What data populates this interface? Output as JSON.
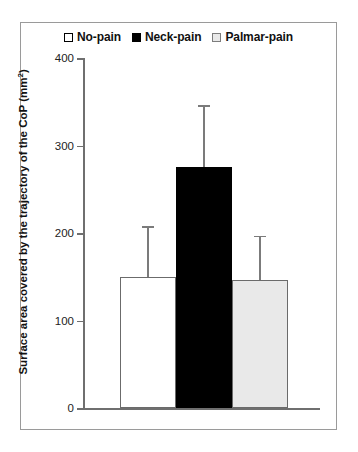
{
  "figure": {
    "background": "#ffffff",
    "frame_border_color": "#9a9a9a"
  },
  "legend": {
    "position": "top-center",
    "entries": [
      {
        "label": "No-pain",
        "swatch": "open-square-icon",
        "fill": "#ffffff",
        "edge": "#000000"
      },
      {
        "label": "Neck-pain",
        "swatch": "filled-square-icon",
        "fill": "#000000",
        "edge": "#000000"
      },
      {
        "label": "Palmar-pain",
        "swatch": "light-gray-square-icon",
        "fill": "#e9e9e9",
        "edge": "#7d7d7d"
      }
    ]
  },
  "axes": {
    "y_title_text": "Surface area covered by the trajectory of the CoP (mm",
    "y_title_sup": "2",
    "y_title_tail": ")",
    "y_ticks": [
      "0",
      "100",
      "200",
      "300",
      "400"
    ],
    "y_tick_values": [
      0,
      100,
      200,
      300,
      400
    ],
    "ylim": [
      0,
      400
    ],
    "x_ticks": [],
    "grid": false
  },
  "chart_data": {
    "type": "bar",
    "title": "",
    "subtitle": "",
    "xlabel": "",
    "ylabel": "Surface area covered by the trajectory of the CoP (mm²)",
    "ylim": [
      0,
      400
    ],
    "grid": false,
    "legend_position": "top-center",
    "categories": [
      "No-pain",
      "Neck-pain",
      "Palmar-pain"
    ],
    "values": [
      150,
      276,
      146
    ],
    "errors": [
      58,
      70,
      51
    ],
    "error_type": "upper-only",
    "bar_styles": [
      {
        "fill": "#ffffff",
        "edge": "#6b6b6b"
      },
      {
        "fill": "#000000",
        "edge": "#000000"
      },
      {
        "fill": "#e9e9e9",
        "edge": "#6b6b6b"
      }
    ],
    "series": [
      {
        "name": "Surface area of CoP trajectory",
        "values": [
          150,
          276,
          146
        ],
        "errors": [
          58,
          70,
          51
        ]
      }
    ]
  }
}
